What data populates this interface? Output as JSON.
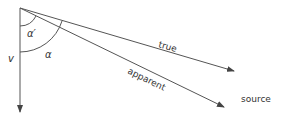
{
  "diagram": {
    "labels": {
      "true": "true",
      "apparent": "apparent",
      "source": "source",
      "velocity": "v",
      "alpha": "α",
      "alpha_prime": "α′"
    },
    "colors": {
      "line": "#555555",
      "text": "#333333",
      "background": "#ffffff"
    },
    "geometry": {
      "origin": [
        20,
        8
      ],
      "velocity_end": [
        20,
        112
      ],
      "true_end": [
        234,
        71
      ],
      "apparent_end": [
        224,
        107
      ]
    }
  }
}
